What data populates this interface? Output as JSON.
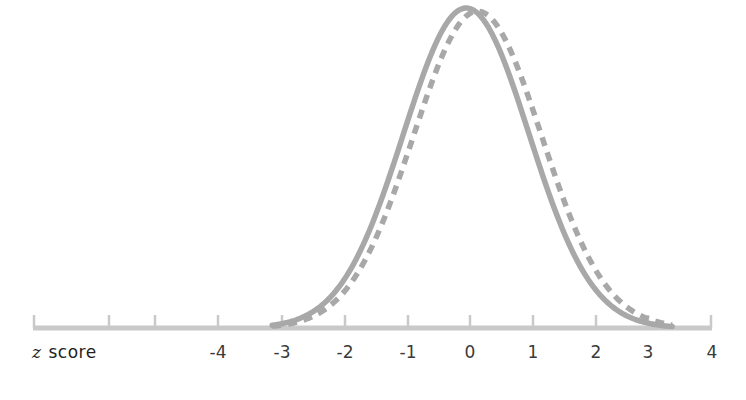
{
  "figure": {
    "axis_title": "z score",
    "axis_title_italic_part": "z",
    "axis_title_roman_part": "score",
    "background_color": "#ffffff",
    "curve_color": "#a8a8a8",
    "axis_color": "#c9c9c9",
    "label_color": "#231f20"
  },
  "chart_data": {
    "type": "line",
    "title": "",
    "xlabel": "z score",
    "ylabel": "",
    "xlim": [
      -5,
      4
    ],
    "ylim": [
      0,
      1.08
    ],
    "grid": false,
    "legend_position": "none",
    "x_ticks": [
      -5,
      -4,
      -3,
      -2,
      -1,
      0,
      1,
      2,
      3,
      4
    ],
    "x_tick_labels": [
      "",
      "-4",
      "-3",
      "-2",
      "-1",
      "0",
      "1",
      "2",
      "3",
      "4"
    ],
    "y_ticks": [],
    "y_tick_labels": [],
    "series": [
      {
        "name": "solid-normal-curve",
        "style": "solid",
        "color": "#a8a8a8",
        "linewidth": 5,
        "distribution": "normal",
        "mean": -0.06,
        "sd": 1.0,
        "peak_value": 1.0,
        "x": [
          -3.2,
          -3.0,
          -2.8,
          -2.6,
          -2.4,
          -2.2,
          -2.0,
          -1.8,
          -1.6,
          -1.4,
          -1.2,
          -1.0,
          -0.8,
          -0.6,
          -0.4,
          -0.2,
          0.0,
          0.2,
          0.4,
          0.6,
          0.8,
          1.0,
          1.2,
          1.4,
          1.6,
          1.8,
          2.0,
          2.2,
          2.4,
          2.6,
          2.8,
          3.0,
          3.2
        ],
        "values": [
          0.007,
          0.012,
          0.021,
          0.034,
          0.054,
          0.082,
          0.12,
          0.168,
          0.227,
          0.296,
          0.372,
          0.452,
          0.592,
          0.706,
          0.813,
          0.901,
          0.963,
          0.996,
          0.998,
          0.969,
          0.91,
          0.826,
          0.724,
          0.612,
          0.5,
          0.394,
          0.3,
          0.22,
          0.156,
          0.106,
          0.07,
          0.044,
          0.027
        ]
      },
      {
        "name": "dashed-normal-curve",
        "style": "dashed",
        "color": "#a8a8a8",
        "linewidth": 5,
        "dash_pattern": "9 7",
        "distribution": "normal",
        "mean": 0.12,
        "sd": 1.02,
        "peak_value": 0.99,
        "x": [
          -3.2,
          -3.0,
          -2.8,
          -2.6,
          -2.4,
          -2.2,
          -2.0,
          -1.8,
          -1.6,
          -1.4,
          -1.2,
          -1.0,
          -0.8,
          -0.6,
          -0.4,
          -0.2,
          0.0,
          0.2,
          0.4,
          0.6,
          0.8,
          1.0,
          1.2,
          1.4,
          1.6,
          1.8,
          2.0,
          2.2,
          2.4,
          2.6,
          2.8,
          3.0,
          3.2
        ],
        "values": [
          0.005,
          0.009,
          0.015,
          0.025,
          0.04,
          0.062,
          0.093,
          0.134,
          0.185,
          0.247,
          0.318,
          0.395,
          0.528,
          0.645,
          0.762,
          0.866,
          0.944,
          0.988,
          0.999,
          0.985,
          0.938,
          0.863,
          0.769,
          0.661,
          0.549,
          0.44,
          0.34,
          0.254,
          0.183,
          0.127,
          0.085,
          0.055,
          0.034
        ]
      }
    ],
    "annotations": []
  },
  "axis": {
    "line_y": 328,
    "start_x": 33,
    "end_x": 712,
    "tick_height": 13,
    "ticks": [
      {
        "value": -5,
        "label": "",
        "x": 33
      },
      {
        "value": -4,
        "label": "-4",
        "x": 108
      },
      {
        "value": -3,
        "label": "-3",
        "x": 183
      },
      {
        "value": -2,
        "label": "-2",
        "x": 258
      },
      {
        "value": -1,
        "label": "-1",
        "x": 333
      },
      {
        "value": 0,
        "label": "0",
        "x": 408
      },
      {
        "value": 1,
        "label": "1",
        "x": 483
      },
      {
        "value": 2,
        "label": "2",
        "x": 558
      },
      {
        "value": 3,
        "label": "3",
        "x": 633
      },
      {
        "value": 4,
        "label": "4",
        "x": 708
      }
    ],
    "visible_tick_labels": [
      "-4",
      "-3",
      "-2",
      "-1",
      "0",
      "1",
      "2",
      "3",
      "4"
    ],
    "label_x_positions": [
      218,
      282,
      345,
      408,
      470,
      533,
      596,
      648,
      712
    ]
  }
}
